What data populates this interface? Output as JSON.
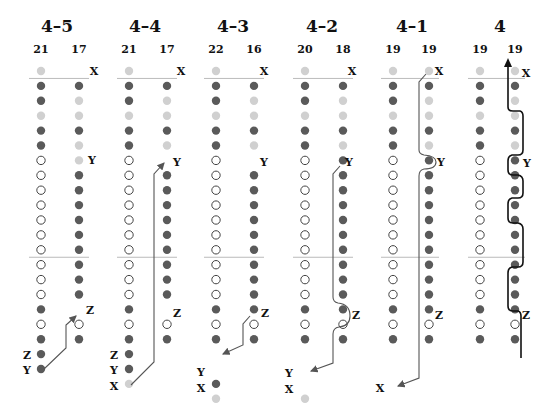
{
  "diagram": {
    "row_y0": 71,
    "row_pitch": 14.9,
    "colors": {
      "dark": "#5a5a5a",
      "light": "#d0d0d0",
      "open_stroke": "#444444",
      "line": "#bbbbbb",
      "path": "#555555",
      "path_bold": "#111111"
    },
    "panels": [
      {
        "title": "4–5",
        "cx": 57,
        "lx": 41,
        "rx": 79,
        "counts": [
          "21",
          "17"
        ],
        "left": [
          "L",
          "D",
          "D",
          "L",
          "D",
          "D",
          "O",
          "O",
          "O",
          "O",
          "O",
          "O",
          "O",
          "O",
          "O",
          "O",
          "D",
          "O",
          "D",
          "D",
          "D"
        ],
        "right": [
          "",
          "D",
          "L",
          "L",
          "D",
          "L",
          "L",
          "D",
          "D",
          "D",
          "D",
          "D",
          "D",
          "D",
          "D",
          "D",
          "",
          "O",
          "D",
          "",
          ""
        ],
        "labels": [
          {
            "text": "X",
            "x": 94,
            "y": 71
          },
          {
            "text": "Y",
            "x": 92,
            "y": 160
          },
          {
            "text": "Z",
            "x": 90,
            "y": 310
          },
          {
            "text": "Z",
            "x": 27,
            "y": 355
          },
          {
            "text": "Y",
            "x": 27,
            "y": 370
          }
        ],
        "path": "M44,369 L66,348 L66,325 L76,316",
        "path_bold": false
      },
      {
        "title": "4–4",
        "cx": 145,
        "lx": 129,
        "rx": 167,
        "counts": [
          "21",
          "17"
        ],
        "left": [
          "L",
          "D",
          "D",
          "L",
          "D",
          "D",
          "O",
          "O",
          "O",
          "O",
          "O",
          "O",
          "O",
          "O",
          "O",
          "O",
          "D",
          "O",
          "D",
          "D",
          "D",
          "L"
        ],
        "right": [
          "",
          "D",
          "L",
          "L",
          "D",
          "L",
          "",
          "D",
          "D",
          "D",
          "D",
          "D",
          "D",
          "D",
          "D",
          "D",
          "",
          "O",
          "D",
          "",
          ""
        ],
        "labels": [
          {
            "text": "X",
            "x": 181,
            "y": 71
          },
          {
            "text": "Y",
            "x": 177,
            "y": 162
          },
          {
            "text": "Z",
            "x": 177,
            "y": 313
          },
          {
            "text": "Z",
            "x": 114,
            "y": 355
          },
          {
            "text": "Y",
            "x": 114,
            "y": 370
          },
          {
            "text": "X",
            "x": 114,
            "y": 386
          }
        ],
        "path": "M131,385 L154,362 L154,174 L164,163",
        "path_bold": false
      },
      {
        "title": "4–3",
        "cx": 233,
        "lx": 216,
        "rx": 254,
        "counts": [
          "22",
          "16"
        ],
        "left": [
          "L",
          "D",
          "D",
          "L",
          "D",
          "D",
          "O",
          "O",
          "O",
          "O",
          "O",
          "O",
          "O",
          "O",
          "O",
          "O",
          "D",
          "O",
          "D",
          "",
          "",
          "D",
          "L"
        ],
        "right": [
          "",
          "D",
          "L",
          "L",
          "D",
          "L",
          "",
          "D",
          "D",
          "D",
          "D",
          "D",
          "D",
          "D",
          "D",
          "D",
          "D",
          "O",
          "D",
          "",
          "",
          ""
        ],
        "labels": [
          {
            "text": "X",
            "x": 264,
            "y": 71
          },
          {
            "text": "Y",
            "x": 264,
            "y": 162
          },
          {
            "text": "Z",
            "x": 265,
            "y": 313
          },
          {
            "text": "Y",
            "x": 201,
            "y": 372
          },
          {
            "text": "X",
            "x": 201,
            "y": 388
          }
        ],
        "path": "M250,316 L243,324 L243,345 L223,354",
        "path_bold": false
      },
      {
        "title": "4–2",
        "cx": 322,
        "lx": 305,
        "rx": 343,
        "counts": [
          "20",
          "18"
        ],
        "left": [
          "L",
          "D",
          "D",
          "L",
          "D",
          "D",
          "O",
          "O",
          "O",
          "O",
          "O",
          "O",
          "O",
          "O",
          "O",
          "O",
          "D",
          "O",
          "D",
          "",
          "",
          "",
          "L"
        ],
        "right": [
          "",
          "D",
          "L",
          "L",
          "D",
          "L",
          "D",
          "D",
          "D",
          "D",
          "D",
          "D",
          "D",
          "D",
          "D",
          "D",
          "D",
          "O",
          "D",
          "",
          "",
          ""
        ],
        "labels": [
          {
            "text": "X",
            "x": 352,
            "y": 71
          },
          {
            "text": "Y",
            "x": 349,
            "y": 162
          },
          {
            "text": "Z",
            "x": 356,
            "y": 315
          },
          {
            "text": "Y",
            "x": 289,
            "y": 373
          },
          {
            "text": "X",
            "x": 289,
            "y": 389
          }
        ],
        "path": "M340,166 L333,174 L333,297 Q333,302 338,303 Q350,304 350,316 Q350,326 339,327 Q333,328 333,334 L333,363 L311,371",
        "path_bold": false
      },
      {
        "title": "4–1",
        "cx": 412,
        "lx": 393,
        "rx": 429,
        "counts": [
          "19",
          "19"
        ],
        "left": [
          "L",
          "D",
          "D",
          "L",
          "D",
          "D",
          "O",
          "O",
          "O",
          "O",
          "O",
          "O",
          "O",
          "O",
          "O",
          "O",
          "D",
          "O",
          "D"
        ],
        "right": [
          "L",
          "D",
          "L",
          "L",
          "D",
          "L",
          "D",
          "D",
          "D",
          "D",
          "D",
          "D",
          "D",
          "D",
          "D",
          "D",
          "D",
          "O",
          "D"
        ],
        "labels": [
          {
            "text": "X",
            "x": 439,
            "y": 71
          },
          {
            "text": "Y",
            "x": 441,
            "y": 162
          },
          {
            "text": "Z",
            "x": 439,
            "y": 315
          },
          {
            "text": "X",
            "x": 380,
            "y": 388
          }
        ],
        "path": "M426,74 L419,82 L419,150 Q419,154 424,155 Q436,156 436,162 Q436,169 424,169 Q419,170 419,176 L419,378 L398,386",
        "path_bold": false
      },
      {
        "title": "4",
        "cx": 500,
        "lx": 480,
        "rx": 515,
        "counts": [
          "19",
          "19"
        ],
        "left": [
          "L",
          "D",
          "D",
          "L",
          "D",
          "D",
          "O",
          "O",
          "O",
          "O",
          "O",
          "O",
          "O",
          "O",
          "O",
          "O",
          "D",
          "O",
          "D"
        ],
        "right": [
          "L",
          "D",
          "L",
          "L",
          "D",
          "L",
          "D",
          "D",
          "D",
          "D",
          "D",
          "D",
          "D",
          "D",
          "D",
          "D",
          "D",
          "O",
          "D"
        ],
        "labels": [
          {
            "text": "X",
            "x": 526,
            "y": 73
          },
          {
            "text": "Y",
            "x": 527,
            "y": 163
          },
          {
            "text": "Z",
            "x": 526,
            "y": 315
          },
          {
            "text": "19",
            "x": 480,
            "y": 50
          },
          {
            "text": "19",
            "x": 516,
            "y": 50
          }
        ],
        "path": "M508,64 L508,107 Q508,111 513,111 L520,111 Q523,112 523,116 L523,150 Q523,155 518,155 L512,155 Q508,156 508,161 L508,170 Q508,175 513,175 L518,175 Q523,176 523,181 L523,193 Q523,198 518,198 L512,198 Q508,199 508,204 L508,218 Q508,223 513,223 L518,223 Q523,224 523,229 L523,262 Q523,267 518,267 L512,267 Q508,268 508,273 L508,306 Q508,311 513,311 L518,311 Q521,312 521,316 L521,358",
        "path_bold": true
      }
    ]
  }
}
